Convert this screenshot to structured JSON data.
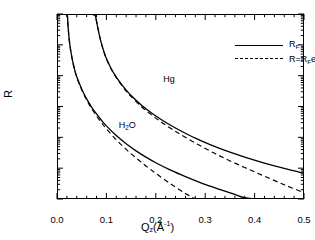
{
  "chart_data": {
    "type": "line",
    "title": "",
    "xlabel": "Qz(Å-1)",
    "ylabel": "R",
    "xlim": [
      0.0,
      0.5
    ],
    "ylim": [
      1e-06,
      1.0
    ],
    "yscale": "log",
    "grid": false,
    "legend_position": "upper-right",
    "xticks": [
      "0.0",
      "0.1",
      "0.2",
      "0.3",
      "0.4",
      "0.5"
    ],
    "xtick_values": [
      0.0,
      0.1,
      0.2,
      0.3,
      0.4,
      0.5
    ],
    "ytick_exponents": [
      "0",
      "-2",
      "-4",
      "-6"
    ],
    "ytick_values": [
      1.0,
      0.01,
      0.0001,
      1e-06
    ],
    "annotations": [
      {
        "text": "Hg",
        "x": 0.215,
        "y": 0.0075
      },
      {
        "text": "H2O",
        "x": 0.125,
        "y": 0.00024
      }
    ],
    "series": [
      {
        "name": "Hg-fresnel",
        "label": "RF",
        "style": "solid",
        "material": "Hg",
        "qc": 0.079,
        "points": [
          [
            0.0,
            1.0
          ],
          [
            0.02,
            1.0
          ],
          [
            0.04,
            1.0
          ],
          [
            0.055,
            1.0
          ],
          [
            0.065,
            0.99
          ],
          [
            0.072,
            0.97
          ],
          [
            0.077,
            0.9
          ],
          [
            0.079,
            0.7
          ],
          [
            0.082,
            0.4
          ],
          [
            0.086,
            0.2
          ],
          [
            0.09,
            0.11
          ],
          [
            0.095,
            0.06
          ],
          [
            0.1,
            0.036
          ],
          [
            0.11,
            0.0165
          ],
          [
            0.12,
            0.009
          ],
          [
            0.13,
            0.0054
          ],
          [
            0.14,
            0.0034
          ],
          [
            0.15,
            0.00228
          ],
          [
            0.17,
            0.00114
          ],
          [
            0.19,
            0.000638
          ],
          [
            0.21,
            0.000385
          ],
          [
            0.23,
            0.000246
          ],
          [
            0.25,
            0.000164
          ],
          [
            0.28,
            9.4e-05
          ],
          [
            0.31,
            5.78e-05
          ],
          [
            0.34,
            3.75e-05
          ],
          [
            0.38,
            2.28e-05
          ],
          [
            0.42,
            1.46e-05
          ],
          [
            0.46,
            9.8e-06
          ],
          [
            0.5,
            6.8e-06
          ]
        ]
      },
      {
        "name": "Hg-rough",
        "label": "R=RFe-q2s2",
        "style": "dashed",
        "material": "Hg",
        "qc": 0.079,
        "sigma": 1.0,
        "points": [
          [
            0.0,
            1.0
          ],
          [
            0.04,
            1.0
          ],
          [
            0.065,
            0.99
          ],
          [
            0.072,
            0.97
          ],
          [
            0.077,
            0.9
          ],
          [
            0.079,
            0.7
          ],
          [
            0.082,
            0.4
          ],
          [
            0.086,
            0.2
          ],
          [
            0.09,
            0.109
          ],
          [
            0.095,
            0.059
          ],
          [
            0.1,
            0.0352
          ],
          [
            0.11,
            0.016
          ],
          [
            0.12,
            0.00864
          ],
          [
            0.13,
            0.00512
          ],
          [
            0.14,
            0.00318
          ],
          [
            0.15,
            0.0021
          ],
          [
            0.17,
            0.00102
          ],
          [
            0.19,
            0.000554
          ],
          [
            0.21,
            0.000322
          ],
          [
            0.23,
            0.000197
          ],
          [
            0.25,
            0.000125
          ],
          [
            0.28,
            6.55e-05
          ],
          [
            0.31,
            3.6e-05
          ],
          [
            0.34,
            2.06e-05
          ],
          [
            0.38,
            1.05e-05
          ],
          [
            0.42,
            5.5e-06
          ],
          [
            0.46,
            2.9e-06
          ],
          [
            0.5,
            1.6e-06
          ]
        ]
      },
      {
        "name": "H2O-fresnel",
        "label": "RF",
        "style": "solid",
        "material": "H2O",
        "qc": 0.0217,
        "points": [
          [
            0.0,
            1.0
          ],
          [
            0.012,
            1.0
          ],
          [
            0.018,
            0.98
          ],
          [
            0.021,
            0.86
          ],
          [
            0.0217,
            0.6
          ],
          [
            0.023,
            0.3
          ],
          [
            0.025,
            0.135
          ],
          [
            0.028,
            0.062
          ],
          [
            0.032,
            0.028
          ],
          [
            0.036,
            0.0152
          ],
          [
            0.04,
            0.0092
          ],
          [
            0.05,
            0.00368
          ],
          [
            0.06,
            0.00176
          ],
          [
            0.07,
            0.00096
          ],
          [
            0.08,
            0.000572
          ],
          [
            0.09,
            0.000358
          ],
          [
            0.1,
            0.000235
          ],
          [
            0.12,
            0.000114
          ],
          [
            0.14,
            6.18e-05
          ],
          [
            0.16,
            3.64e-05
          ],
          [
            0.18,
            2.28e-05
          ],
          [
            0.2,
            1.5e-05
          ],
          [
            0.23,
            8.6e-06
          ],
          [
            0.26,
            5.3e-06
          ],
          [
            0.29,
            3.4e-06
          ],
          [
            0.32,
            2.3e-06
          ],
          [
            0.34,
            1.8e-06
          ],
          [
            0.36,
            1.4e-06
          ],
          [
            0.38,
            1.1e-06
          ],
          [
            0.4,
            9e-07
          ]
        ]
      },
      {
        "name": "H2O-rough",
        "label": "R=RFe-q2s2",
        "style": "dashed",
        "material": "H2O",
        "qc": 0.0217,
        "sigma": 3.0,
        "points": [
          [
            0.0,
            1.0
          ],
          [
            0.012,
            1.0
          ],
          [
            0.018,
            0.98
          ],
          [
            0.021,
            0.86
          ],
          [
            0.0217,
            0.6
          ],
          [
            0.023,
            0.3
          ],
          [
            0.025,
            0.134
          ],
          [
            0.028,
            0.061
          ],
          [
            0.032,
            0.0274
          ],
          [
            0.036,
            0.0148
          ],
          [
            0.04,
            0.0089
          ],
          [
            0.05,
            0.00348
          ],
          [
            0.06,
            0.00162
          ],
          [
            0.07,
            0.00086
          ],
          [
            0.08,
            0.000494
          ],
          [
            0.09,
            0.000298
          ],
          [
            0.1,
            0.000188
          ],
          [
            0.12,
            8.34e-05
          ],
          [
            0.14,
            4.08e-05
          ],
          [
            0.16,
            2.14e-05
          ],
          [
            0.18,
            1.18e-05
          ],
          [
            0.2,
            6.8e-06
          ],
          [
            0.23,
            3.1e-06
          ],
          [
            0.26,
            1.5e-06
          ],
          [
            0.28,
            9e-07
          ]
        ]
      }
    ]
  },
  "axes": {
    "ylabel": "R",
    "xlabel_base": "Q",
    "xlabel_sub": "z",
    "xlabel_unit_open": "(Å",
    "xlabel_unit_sup": "-1",
    "xlabel_unit_close": ")"
  },
  "legend": {
    "entries": [
      {
        "style": "solid",
        "base": "R",
        "sub": "F",
        "tail": "",
        "exp": ""
      },
      {
        "style": "dashed",
        "base": "R=R",
        "sub": "F",
        "tail": "e",
        "exp": "-q²σ²"
      }
    ]
  }
}
